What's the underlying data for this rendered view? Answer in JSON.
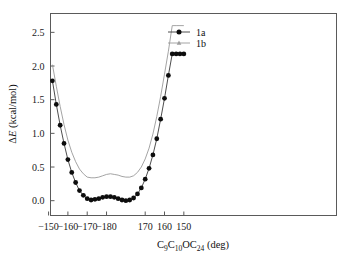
{
  "chart_data": {
    "type": "line",
    "title": "",
    "xlabel": "C9C10OC24 (deg)",
    "xlabel_parts": [
      {
        "text": "C",
        "sub": false
      },
      {
        "text": "9",
        "sub": true
      },
      {
        "text": "C",
        "sub": false
      },
      {
        "text": "10",
        "sub": true
      },
      {
        "text": "OC",
        "sub": false
      },
      {
        "text": "24",
        "sub": true
      },
      {
        "text": " (deg)",
        "sub": false
      }
    ],
    "ylabel": "ΔE (kcal/mol)",
    "xlim": [
      -148,
      148
    ],
    "ylim": [
      -0.22,
      2.78
    ],
    "grid": false,
    "legend_position": "top-center",
    "xticks": [
      -150,
      -160,
      -170,
      -180,
      170,
      160,
      150
    ],
    "xtick_labels": [
      "−150",
      "−160",
      "−170",
      "−180",
      "170",
      "160",
      "150"
    ],
    "xtick_positions": [
      -150,
      -130,
      -110,
      -90,
      -50,
      -30,
      -10
    ],
    "yticks": [
      0.0,
      0.5,
      1.0,
      1.5,
      2.0,
      2.5
    ],
    "ytick_labels": [
      "0.0",
      "0.5",
      "1.0",
      "1.5",
      "2.0",
      "2.5"
    ],
    "x": [
      -150,
      -146,
      -142,
      -138,
      -134,
      -130,
      -126,
      -122,
      -118,
      -114,
      -110,
      -106,
      -102,
      -98,
      -94,
      -90,
      -86,
      -82,
      -78,
      -74,
      -70,
      -66,
      -62,
      -58,
      -54,
      -50,
      -46,
      -42,
      -38,
      -34,
      -30,
      -26,
      -22,
      -18,
      -14,
      -10
    ],
    "x_display_labels": [
      "-150",
      "-152",
      "-154",
      "-156",
      "-158",
      "-160",
      "-162",
      "-164",
      "-166",
      "-168",
      "-170",
      "-172",
      "-174",
      "-176",
      "-178",
      "-180/180",
      "178",
      "176",
      "174",
      "172",
      "170",
      "168",
      "166",
      "164",
      "162",
      "160",
      "158",
      "156",
      "154",
      "152",
      "150",
      "148",
      "146",
      "144",
      "142",
      "140"
    ],
    "series": [
      {
        "name": "1a",
        "marker": "circle",
        "color": "#0d0d0d",
        "line_color": "#3a3a3a",
        "values": [
          2.17,
          1.78,
          1.43,
          1.12,
          0.85,
          0.61,
          0.42,
          0.27,
          0.15,
          0.08,
          0.03,
          0.01,
          0.02,
          0.03,
          0.05,
          0.06,
          0.06,
          0.05,
          0.03,
          0.01,
          0.0,
          0.01,
          0.04,
          0.1,
          0.19,
          0.32,
          0.48,
          0.68,
          0.92,
          1.21,
          1.52,
          1.86,
          2.18,
          2.18,
          2.18,
          2.18
        ]
      },
      {
        "name": "1b",
        "marker": "triangle",
        "color": "#9d9d9d",
        "line_color": "#9a9a9a",
        "values": [
          2.4,
          2.02,
          1.7,
          1.4,
          1.13,
          0.9,
          0.72,
          0.58,
          0.47,
          0.4,
          0.35,
          0.34,
          0.34,
          0.35,
          0.37,
          0.39,
          0.4,
          0.39,
          0.38,
          0.36,
          0.35,
          0.35,
          0.37,
          0.42,
          0.5,
          0.62,
          0.78,
          0.99,
          1.25,
          1.55,
          1.88,
          2.22,
          2.6,
          2.6,
          2.6,
          2.6
        ]
      }
    ],
    "legend_entries": [
      {
        "label": "1a",
        "marker": "circle",
        "color": "#0d0d0d"
      },
      {
        "label": "1b",
        "marker": "triangle",
        "color": "#9d9d9d"
      }
    ]
  },
  "figure": {
    "background": "#ffffff",
    "frame_color": "#5a5a5a"
  }
}
